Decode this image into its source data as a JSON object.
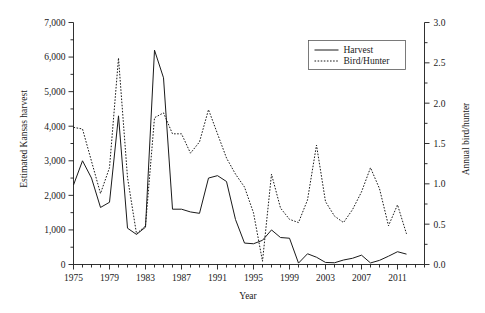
{
  "chart_data": {
    "type": "line",
    "title": "",
    "xlabel": "Year",
    "ylabel": "Estimated Kansas harvest",
    "ylabel_right": "Annual bird/hunter",
    "xlim": [
      1975,
      2014
    ],
    "ylim": [
      0,
      7000
    ],
    "ylim_right": [
      0.0,
      3.0
    ],
    "grid": false,
    "legend_position": "top-right",
    "xticks_major": [
      1975,
      1979,
      1983,
      1987,
      1991,
      1995,
      1999,
      2003,
      2007,
      2011
    ],
    "xtick_labels": [
      "1975",
      "1979",
      "1983",
      "1987",
      "1991",
      "1995",
      "1999",
      "2003",
      "2007",
      "2011"
    ],
    "xtick_minor_step": 1,
    "yticks_left": [
      0,
      1000,
      2000,
      3000,
      4000,
      5000,
      6000,
      7000
    ],
    "ytick_labels_left": [
      "0",
      "1,000",
      "2,000",
      "3,000",
      "4,000",
      "5,000",
      "6,000",
      "7,000"
    ],
    "ytick_minor_step_left": 500,
    "yticks_right": [
      0.0,
      0.5,
      1.0,
      1.5,
      2.0,
      2.5,
      3.0
    ],
    "ytick_labels_right": [
      "0.0",
      "0.5",
      "1.0",
      "1.5",
      "2.0",
      "2.5",
      "3.0"
    ],
    "ytick_minor_step_right": 0.25,
    "x": [
      1975,
      1976,
      1977,
      1978,
      1979,
      1980,
      1981,
      1982,
      1983,
      1984,
      1985,
      1986,
      1987,
      1988,
      1989,
      1990,
      1991,
      1992,
      1993,
      1994,
      1995,
      1996,
      1997,
      1998,
      1999,
      2000,
      2001,
      2002,
      2003,
      2004,
      2005,
      2006,
      2007,
      2008,
      2009,
      2010,
      2011,
      2012
    ],
    "series": [
      {
        "name": "Harvest",
        "axis": "left",
        "style": "solid",
        "color": "#1a1a1a",
        "values": [
          2300,
          3000,
          2500,
          1650,
          1800,
          4300,
          1050,
          870,
          1080,
          6200,
          5400,
          1600,
          1600,
          1520,
          1480,
          2500,
          2570,
          2400,
          1300,
          620,
          600,
          700,
          1000,
          780,
          760,
          40,
          310,
          210,
          60,
          50,
          130,
          180,
          270,
          45,
          120,
          240,
          370,
          300
        ]
      },
      {
        "name": "Bird/Hunter",
        "axis": "right",
        "style": "dotted",
        "color": "#1a1a1a",
        "values": [
          1.7,
          1.68,
          1.28,
          0.88,
          1.2,
          2.56,
          1.08,
          0.38,
          0.48,
          1.82,
          1.88,
          1.62,
          1.62,
          1.38,
          1.52,
          1.92,
          1.62,
          1.32,
          1.12,
          0.96,
          0.64,
          0.04,
          1.12,
          0.7,
          0.56,
          0.52,
          0.8,
          1.48,
          0.78,
          0.6,
          0.52,
          0.68,
          0.9,
          1.2,
          0.94,
          0.48,
          0.74,
          0.38
        ]
      }
    ]
  },
  "legend": {
    "entries": [
      {
        "label": "Harvest",
        "style": "solid"
      },
      {
        "label": "Bird/Hunter",
        "style": "dotted"
      }
    ]
  },
  "axes": {
    "x_title": "Year",
    "y_left_title": "Estimated Kansas harvest",
    "y_right_title": "Annual bird/hunter"
  }
}
